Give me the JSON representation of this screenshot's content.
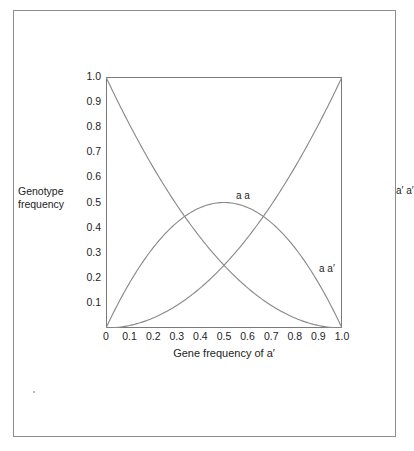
{
  "figure": {
    "border_color": "#8d8d8d",
    "background": "#ffffff"
  },
  "axes": {
    "x_title": "Gene frequency of  a′",
    "y_title_line1": "Genotype",
    "y_title_line2": "frequency",
    "x_ticks": [
      "0",
      "0.1",
      "0.2",
      "0.3",
      "0.4",
      "0.5",
      "0.6",
      "0.7",
      "0.8",
      "0.9",
      "1.0"
    ],
    "y_ticks": [
      "1.0",
      "0.9",
      "0.8",
      "0.7",
      "0.6",
      "0.5",
      "0.4",
      "0.3",
      "0.2",
      "0.1"
    ],
    "frame_color": "#7a7a7a"
  },
  "curve_labels": {
    "homozygote_a": "a a",
    "heterozygote": "a a′",
    "homozygote_aprime": "a′ a′"
  },
  "chart_data": {
    "type": "line",
    "title": "",
    "subtitle": "",
    "xlabel": "Gene frequency of  a′",
    "ylabel": "Genotype frequency",
    "xlim": [
      0,
      1.0
    ],
    "ylim": [
      0,
      1.0
    ],
    "grid": false,
    "legend": "inline annotations on curves",
    "line_color": "#8a8a8a",
    "x": [
      0,
      0.05,
      0.1,
      0.15,
      0.2,
      0.25,
      0.3,
      0.35,
      0.4,
      0.45,
      0.5,
      0.55,
      0.6,
      0.65,
      0.7,
      0.75,
      0.8,
      0.85,
      0.9,
      0.95,
      1.0
    ],
    "series": [
      {
        "name": "a a",
        "annotation": "a a",
        "formula": "(1 - q)^2",
        "values": [
          1.0,
          0.9025,
          0.81,
          0.7225,
          0.64,
          0.5625,
          0.49,
          0.4225,
          0.36,
          0.3025,
          0.25,
          0.2025,
          0.16,
          0.1225,
          0.09,
          0.0625,
          0.04,
          0.0225,
          0.01,
          0.0025,
          0.0
        ]
      },
      {
        "name": "a a′",
        "annotation": "a a′",
        "formula": "2q(1 - q)",
        "values": [
          0.0,
          0.095,
          0.18,
          0.255,
          0.32,
          0.375,
          0.42,
          0.455,
          0.48,
          0.495,
          0.5,
          0.495,
          0.48,
          0.455,
          0.42,
          0.375,
          0.32,
          0.255,
          0.18,
          0.095,
          0.0
        ]
      },
      {
        "name": "a′ a′",
        "annotation": "a′ a′",
        "formula": "q^2",
        "values": [
          0.0,
          0.0025,
          0.01,
          0.0225,
          0.04,
          0.0625,
          0.09,
          0.1225,
          0.16,
          0.2025,
          0.25,
          0.3025,
          0.36,
          0.4225,
          0.49,
          0.5625,
          0.64,
          0.7225,
          0.81,
          0.9025,
          1.0
        ]
      }
    ],
    "annotations": [
      {
        "text": "a a",
        "x": 0.12,
        "y": 0.83
      },
      {
        "text": "a a′",
        "x": 0.47,
        "y": 0.54
      },
      {
        "text": "a′ a′",
        "x": 0.82,
        "y": 0.85
      }
    ]
  }
}
